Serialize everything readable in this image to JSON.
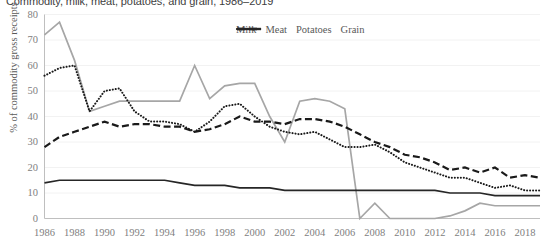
{
  "chart_data": {
    "type": "line",
    "title": "Commodity, milk, meat, potatoes, and grain, 1986–2019",
    "xlabel": "",
    "ylabel": "% of commodity gross receipts",
    "ylim": [
      0,
      80
    ],
    "ytick_step": 10,
    "yticks": [
      "0",
      "10",
      "20",
      "30",
      "40",
      "50",
      "60",
      "70",
      "80"
    ],
    "grid": true,
    "legend_position": "top-right",
    "x": [
      1986,
      1987,
      1988,
      1989,
      1990,
      1991,
      1992,
      1993,
      1994,
      1995,
      1996,
      1997,
      1998,
      1999,
      2000,
      2001,
      2002,
      2003,
      2004,
      2005,
      2006,
      2007,
      2008,
      2009,
      2010,
      2011,
      2012,
      2013,
      2014,
      2015,
      2016,
      2017,
      2018,
      2019
    ],
    "xticks": [
      "1986",
      "1988",
      "1990",
      "1992",
      "1994",
      "1996",
      "1998",
      "2000",
      "2002",
      "2004",
      "2006",
      "2008",
      "2010",
      "2012",
      "2014",
      "2016",
      "2018"
    ],
    "series": [
      {
        "name": "Milk",
        "color": "#A6A6A6",
        "style": "solid",
        "values": [
          72,
          77,
          62,
          42,
          44,
          46,
          46,
          46,
          46,
          46,
          60,
          47,
          52,
          53,
          53,
          40,
          30,
          46,
          47,
          46,
          43,
          0,
          6,
          0,
          0,
          0,
          0,
          1,
          3,
          6,
          5,
          5,
          5,
          5
        ]
      },
      {
        "name": "Meat",
        "color": "#1A1A1A",
        "style": "dashed",
        "values": [
          28,
          32,
          34,
          36,
          38,
          36,
          37,
          37,
          36,
          36,
          34,
          35,
          37,
          40,
          38,
          38,
          37,
          39,
          39,
          38,
          36,
          33,
          30,
          28,
          25,
          24,
          22,
          19,
          20,
          18,
          20,
          16,
          17,
          16
        ]
      },
      {
        "name": "Potatoes",
        "color": "#1A1A1A",
        "style": "dotted",
        "values": [
          56,
          59,
          60,
          42,
          50,
          51,
          42,
          38,
          38,
          37,
          34,
          38,
          44,
          45,
          40,
          36,
          34,
          33,
          34,
          31,
          28,
          28,
          29,
          26,
          22,
          20,
          18,
          16,
          16,
          14,
          12,
          13,
          11,
          11
        ]
      },
      {
        "name": "Grain",
        "color": "#262626",
        "style": "solid-dark",
        "values": [
          14,
          15,
          15,
          15,
          15,
          15,
          15,
          15,
          15,
          14,
          13,
          13,
          13,
          12,
          12,
          12,
          11,
          11,
          11,
          11,
          11,
          11,
          11,
          11,
          11,
          11,
          11,
          10,
          10,
          10,
          9,
          9,
          9,
          9
        ]
      }
    ]
  },
  "legend": {
    "items": [
      {
        "label": "Milk",
        "swatch": "milk-swatch"
      },
      {
        "label": "Meat",
        "swatch": "meat-swatch"
      },
      {
        "label": "Potatoes",
        "swatch": "potatoes-swatch"
      },
      {
        "label": "Grain",
        "swatch": "grain-swatch"
      }
    ]
  }
}
